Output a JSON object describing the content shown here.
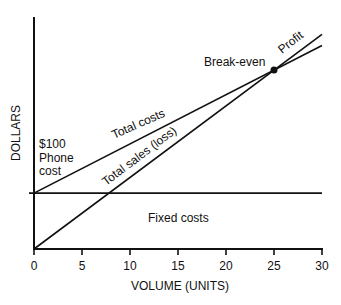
{
  "chart_data": {
    "type": "line",
    "title": "",
    "xlabel": "VOLUME (UNITS)",
    "ylabel": "DOLLARS",
    "xlim": [
      0,
      30
    ],
    "ylim": [
      0,
      415
    ],
    "x_ticks": [
      0,
      5,
      10,
      15,
      20,
      25,
      30
    ],
    "x_tick_labels": [
      "0",
      "5",
      "10",
      "15",
      "20",
      "25",
      "30"
    ],
    "grid": false,
    "series": [
      {
        "name": "Total costs",
        "x": [
          0,
          30
        ],
        "values": [
          100,
          364
        ]
      },
      {
        "name": "Total sales (loss)",
        "x": [
          0,
          30
        ],
        "values": [
          0,
          384
        ]
      },
      {
        "name": "Fixed costs",
        "x": [
          0,
          30
        ],
        "values": [
          100,
          100
        ]
      }
    ],
    "break_even": {
      "x": 25,
      "y": 320,
      "label": "Break-even"
    },
    "annotations": {
      "fixed_level_label": [
        "$100",
        "Phone",
        "cost"
      ],
      "total_costs": "Total costs",
      "total_sales": "Total sales (loss)",
      "fixed_costs": "Fixed costs",
      "profit": "Profit",
      "break_even": "Break-even"
    }
  }
}
